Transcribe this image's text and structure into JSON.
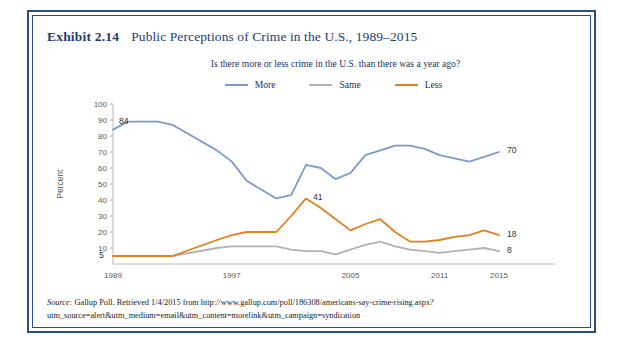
{
  "exhibit": {
    "number": "Exhibit 2.14",
    "title": "Public Perceptions of Crime in the U.S., 1989–2015",
    "border_color": "#2B4E86"
  },
  "source": {
    "label": "Source:",
    "text": " Gallup Poll. Retrieved 1/4/2015 from http://www.gallup.com/poll/186308/americans-say-crime-rising.aspx?utm_source=alert&utm_medium=email&utm_content=morelink&utm_campaign=syndication"
  },
  "legend": {
    "items": [
      {
        "label": "More",
        "color": "#7B9BCE"
      },
      {
        "label": "Same",
        "color": "#B2B2B2"
      },
      {
        "label": "Less",
        "color": "#E3801F"
      }
    ]
  },
  "chart_data": {
    "type": "line",
    "title": "Is there more or less crime in the U.S. than there was a year ago?",
    "xlabel": "",
    "ylabel": "Percent",
    "ylim": [
      0,
      100
    ],
    "ytick_values": [
      10,
      20,
      30,
      40,
      50,
      60,
      70,
      80,
      90,
      100
    ],
    "ytick_labels": [
      "10",
      "20",
      "30",
      "40",
      "50",
      "60",
      "70",
      "80",
      "90",
      "100"
    ],
    "xlim": [
      1989,
      2015
    ],
    "xtick_values": [
      1989,
      1997,
      2005,
      2011,
      2015
    ],
    "xtick_labels": [
      "1989",
      "1997",
      "2005",
      "2011",
      "2015"
    ],
    "grid": false,
    "legend_position": "top-center",
    "x": [
      1989,
      1990,
      1992,
      1993,
      1996,
      1997,
      1998,
      2000,
      2001,
      2002,
      2003,
      2004,
      2005,
      2006,
      2007,
      2008,
      2009,
      2010,
      2011,
      2012,
      2013,
      2014,
      2015
    ],
    "series": [
      {
        "name": "More",
        "color": "#7B9BCE",
        "values": [
          84,
          89,
          89,
          87,
          71,
          64,
          52,
          41,
          43,
          62,
          60,
          53,
          57,
          68,
          71,
          74,
          74,
          72,
          68,
          66,
          64,
          67,
          70
        ]
      },
      {
        "name": "Same",
        "color": "#B2B2B2",
        "values": [
          5,
          5,
          5,
          5,
          10,
          11,
          11,
          11,
          9,
          8,
          8,
          6,
          9,
          12,
          14,
          11,
          9,
          8,
          7,
          8,
          9,
          10,
          8
        ]
      },
      {
        "name": "Less",
        "color": "#E3801F",
        "values": [
          5,
          5,
          5,
          5,
          15,
          18,
          20,
          20,
          30,
          41,
          35,
          28,
          21,
          25,
          28,
          20,
          14,
          14,
          15,
          17,
          18,
          21,
          18
        ]
      }
    ],
    "annotations": [
      {
        "text": "84",
        "series": "More",
        "x": 1989,
        "value": 84
      },
      {
        "text": "70",
        "series": "More",
        "x": 2015,
        "value": 70
      },
      {
        "text": "41",
        "series": "Less",
        "x": 2002,
        "value": 41
      },
      {
        "text": "18",
        "series": "Less",
        "x": 2015,
        "value": 18
      },
      {
        "text": "8",
        "series": "Same",
        "x": 2015,
        "value": 8
      },
      {
        "text": "5",
        "series": "Less",
        "x": 1989,
        "value": 5
      }
    ]
  }
}
